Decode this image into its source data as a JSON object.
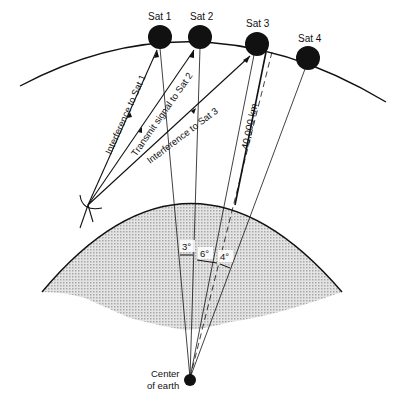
{
  "diagram": {
    "type": "satellite-interference-geometry",
    "colors": {
      "ink": "#111111",
      "earth_fill": "#cfcfcf",
      "background": "#ffffff"
    },
    "satellites": [
      {
        "label": "Sat 1",
        "cx": 160,
        "cy": 37
      },
      {
        "label": "Sat 2",
        "cx": 200,
        "cy": 37
      },
      {
        "label": "Sat 3",
        "cx": 257,
        "cy": 44
      },
      {
        "label": "Sat 4",
        "cx": 308,
        "cy": 58
      }
    ],
    "signal_labels": {
      "interference_sat1": "Interference to Sat 1",
      "transmit_sat2": "Transmit signal to Sat 2",
      "interference_sat3": "Interference to Sat 3"
    },
    "distance_label": "40,000 km",
    "angle_labels": {
      "a1": "3°",
      "a2": "6°",
      "a3": "4°"
    },
    "center_label": {
      "line1": "Center",
      "line2": "of earth"
    },
    "icons": {
      "antenna": "dish-antenna-icon",
      "satellite": "satellite-dot-icon"
    }
  }
}
